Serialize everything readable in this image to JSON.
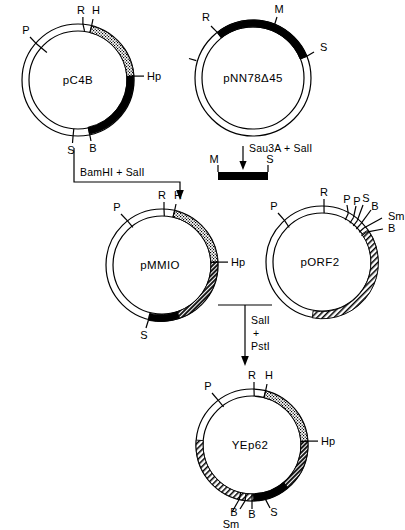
{
  "figure": {
    "type": "plasmid-construction-map",
    "background": "#ffffff",
    "stroke": "#000000"
  },
  "plasmids": [
    {
      "id": "pC4B",
      "name": "pC4B",
      "cx": 78,
      "cy": 80,
      "r": 56,
      "sites": [
        {
          "label": "P",
          "angle": 230,
          "side": "outer-left"
        },
        {
          "label": "R",
          "angle": 275,
          "side": "top"
        },
        {
          "label": "H",
          "angle": 284,
          "side": "top"
        },
        {
          "label": "Hp",
          "angle": 5,
          "side": "right"
        },
        {
          "label": "S",
          "angle": 95,
          "side": "bottom"
        },
        {
          "label": "B",
          "angle": 78,
          "side": "bottom"
        }
      ],
      "segments": [
        {
          "fill": "stipple",
          "from": 284,
          "to": 358
        },
        {
          "fill": "black",
          "from": 358,
          "to": 78
        }
      ]
    },
    {
      "id": "pNN78D45",
      "name": "pNN78Δ45",
      "cx": 253,
      "cy": 78,
      "r": 58,
      "sites": [
        {
          "label": "R",
          "angle": 232,
          "side": "upper-left"
        },
        {
          "label": "M",
          "angle": 292,
          "side": "top"
        },
        {
          "label": "S",
          "angle": 338,
          "side": "right"
        }
      ],
      "segments": [
        {
          "fill": "thick-black",
          "from": 232,
          "to": 338
        }
      ]
    },
    {
      "id": "pMMIO",
      "name": "pMMIO",
      "cx": 162,
      "cy": 265,
      "r": 56,
      "sites": [
        {
          "label": "P",
          "angle": 232,
          "side": "outer-left"
        },
        {
          "label": "R",
          "angle": 272,
          "side": "top"
        },
        {
          "label": "H",
          "angle": 283,
          "side": "top"
        },
        {
          "label": "Hp",
          "angle": 2,
          "side": "right"
        },
        {
          "label": "S",
          "angle": 104,
          "side": "bottom"
        }
      ],
      "segments": [
        {
          "fill": "stipple",
          "from": 283,
          "to": 357
        },
        {
          "fill": "darkhatch",
          "from": 357,
          "to": 72
        },
        {
          "fill": "black",
          "from": 72,
          "to": 104
        }
      ]
    },
    {
      "id": "pORF2",
      "name": "pORF2",
      "cx": 322,
      "cy": 262,
      "r": 56,
      "sites": [
        {
          "label": "P",
          "angle": 228,
          "side": "outer-left"
        },
        {
          "label": "R",
          "angle": 272,
          "side": "top"
        },
        {
          "label": "P",
          "angle": 298,
          "side": "top-right"
        },
        {
          "label": "P",
          "angle": 304,
          "side": "top-right"
        },
        {
          "label": "S",
          "angle": 309,
          "side": "top-right"
        },
        {
          "label": "B",
          "angle": 314,
          "side": "top-right"
        },
        {
          "label": "Sm",
          "angle": 319,
          "side": "right"
        },
        {
          "label": "B",
          "angle": 325,
          "side": "right"
        }
      ],
      "segments": [
        {
          "fill": "hatch",
          "from": 325,
          "to": 100
        }
      ]
    },
    {
      "id": "YEp62",
      "name": "YEp62",
      "cx": 252,
      "cy": 445,
      "r": 56,
      "sites": [
        {
          "label": "P",
          "angle": 233,
          "side": "outer-left"
        },
        {
          "label": "R",
          "angle": 272,
          "side": "top"
        },
        {
          "label": "H",
          "angle": 284,
          "side": "top"
        },
        {
          "label": "Hp",
          "angle": 2,
          "side": "right"
        },
        {
          "label": "S",
          "angle": 76,
          "side": "bottom"
        },
        {
          "label": "B",
          "angle": 90,
          "side": "bottom"
        },
        {
          "label": "B",
          "angle": 97,
          "side": "bottom"
        },
        {
          "label": "Sm",
          "angle": 103,
          "side": "bottom"
        }
      ],
      "segments": [
        {
          "fill": "stipple",
          "from": 284,
          "to": 357
        },
        {
          "fill": "darkhatch",
          "from": 357,
          "to": 50
        },
        {
          "fill": "black",
          "from": 50,
          "to": 88
        },
        {
          "fill": "hatch",
          "from": 88,
          "to": 185
        }
      ]
    }
  ],
  "fragment": {
    "id": "sau3a-sali-fragment",
    "left_label": "M",
    "right_label": "S",
    "x": 218,
    "y": 172,
    "width": 50,
    "height": 8
  },
  "reactions": [
    {
      "id": "bamhi-sali",
      "label": "BamHI + SalI",
      "x": 63,
      "y": 172
    },
    {
      "id": "sau3a-sali",
      "label": "Sau3A + SalI",
      "x": 235,
      "y": 155
    },
    {
      "id": "sali-psti-line1",
      "label": "SalI",
      "x": 250,
      "y": 320
    },
    {
      "id": "sali-psti-plus",
      "label": "+",
      "x": 250,
      "y": 332
    },
    {
      "id": "sali-psti-line2",
      "label": "PstI",
      "x": 250,
      "y": 345
    }
  ]
}
